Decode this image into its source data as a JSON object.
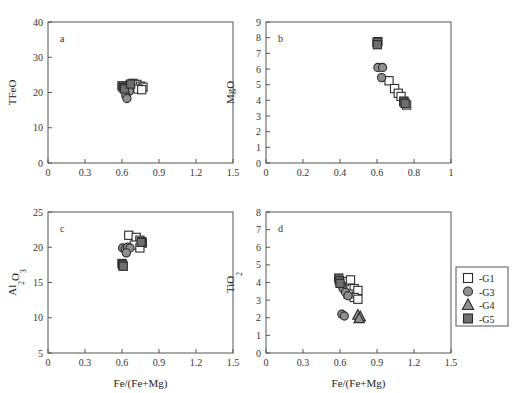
{
  "figure": {
    "width": 517,
    "height": 393,
    "background": "#ffffff"
  },
  "legend": {
    "name": "series-legend",
    "position": "right-of-panel-d",
    "entries": [
      {
        "label": "-G1",
        "marker": "square",
        "fill": "#ffffff",
        "stroke": "#2b2b2b"
      },
      {
        "label": "-G3",
        "marker": "circle",
        "fill": "#8f8f8f",
        "stroke": "#2b2b2b"
      },
      {
        "label": "-G4",
        "marker": "triangle",
        "fill": "#8f8f8f",
        "stroke": "#2b2b2b"
      },
      {
        "label": "-G5",
        "marker": "square",
        "fill": "#6e6e6e",
        "stroke": "#2b2b2b"
      }
    ]
  },
  "chart_data": [
    {
      "id": "panel-a",
      "type": "scatter",
      "panel_letter": "a",
      "title": "",
      "xlabel": "",
      "ylabel": "TFeO",
      "xlim": [
        0,
        1.5
      ],
      "ylim": [
        0,
        40
      ],
      "xticks": [
        0,
        0.3,
        0.6,
        0.9,
        1.2,
        1.5
      ],
      "xticklabels": [
        "0",
        "0.3",
        "0.6",
        "0.9",
        "1.2",
        "1.5"
      ],
      "yticks": [
        0,
        10,
        20,
        30,
        40
      ],
      "yticklabels": [
        "0",
        "10",
        "20",
        "30",
        "40"
      ],
      "grid": false,
      "legend_position": "none",
      "series": [
        {
          "name": "-G1",
          "marker": "square",
          "fill": "#ffffff",
          "stroke": "#2b2b2b",
          "points": [
            [
              0.69,
              22.6
            ],
            [
              0.72,
              22.3
            ],
            [
              0.75,
              21.8
            ],
            [
              0.77,
              21.5
            ],
            [
              0.66,
              22.0
            ],
            [
              0.73,
              21.0
            ],
            [
              0.76,
              20.8
            ]
          ]
        },
        {
          "name": "-G3",
          "marker": "circle",
          "fill": "#8f8f8f",
          "stroke": "#2b2b2b",
          "points": [
            [
              0.62,
              21.3
            ],
            [
              0.64,
              20.6
            ],
            [
              0.66,
              20.4
            ],
            [
              0.63,
              19.2
            ],
            [
              0.64,
              18.3
            ]
          ]
        },
        {
          "name": "-G4",
          "marker": "triangle",
          "fill": "#8f8f8f",
          "stroke": "#2b2b2b",
          "points": []
        },
        {
          "name": "-G5",
          "marker": "square",
          "fill": "#6e6e6e",
          "stroke": "#2b2b2b",
          "points": [
            [
              0.6,
              21.9
            ],
            [
              0.61,
              21.4
            ],
            [
              0.62,
              21.0
            ],
            [
              0.67,
              22.4
            ]
          ]
        }
      ]
    },
    {
      "id": "panel-b",
      "type": "scatter",
      "panel_letter": "b",
      "title": "",
      "xlabel": "",
      "ylabel": "MgO",
      "xlim": [
        0,
        1
      ],
      "ylim": [
        0,
        9
      ],
      "xticks": [
        0,
        0.2,
        0.4,
        0.6,
        0.8,
        1
      ],
      "xticklabels": [
        "0",
        "0.2",
        "0.4",
        "0.6",
        "0.8",
        "1"
      ],
      "yticks": [
        0,
        1,
        2,
        3,
        4,
        5,
        6,
        7,
        8,
        9
      ],
      "yticklabels": [
        "0",
        "1",
        "2",
        "3",
        "4",
        "5",
        "6",
        "7",
        "8",
        "9"
      ],
      "grid": false,
      "legend_position": "none",
      "series": [
        {
          "name": "-G1",
          "marker": "square",
          "fill": "#ffffff",
          "stroke": "#2b2b2b",
          "points": [
            [
              0.665,
              5.25
            ],
            [
              0.695,
              4.75
            ],
            [
              0.715,
              4.45
            ],
            [
              0.73,
              4.25
            ],
            [
              0.745,
              3.95
            ],
            [
              0.76,
              3.7
            ],
            [
              0.605,
              7.75
            ]
          ]
        },
        {
          "name": "-G3",
          "marker": "circle",
          "fill": "#8f8f8f",
          "stroke": "#2b2b2b",
          "points": [
            [
              0.605,
              6.1
            ],
            [
              0.63,
              6.1
            ],
            [
              0.625,
              5.45
            ]
          ]
        },
        {
          "name": "-G4",
          "marker": "triangle",
          "fill": "#8f8f8f",
          "stroke": "#2b2b2b",
          "points": []
        },
        {
          "name": "-G5",
          "marker": "square",
          "fill": "#6e6e6e",
          "stroke": "#2b2b2b",
          "points": [
            [
              0.6,
              7.7
            ],
            [
              0.602,
              7.55
            ],
            [
              0.745,
              3.9
            ],
            [
              0.752,
              3.8
            ]
          ]
        }
      ]
    },
    {
      "id": "panel-c",
      "type": "scatter",
      "panel_letter": "c",
      "title": "",
      "xlabel": "Fe/(Fe+Mg)",
      "ylabel": "Al2O3",
      "xlim": [
        0,
        1.5
      ],
      "ylim": [
        5,
        25
      ],
      "xticks": [
        0,
        0.3,
        0.6,
        0.9,
        1.2,
        1.5
      ],
      "xticklabels": [
        "0",
        "0.3",
        "0.6",
        "0.9",
        "1.2",
        "1.5"
      ],
      "yticks": [
        5,
        10,
        15,
        20,
        25
      ],
      "yticklabels": [
        "5",
        "10",
        "15",
        "20",
        "25"
      ],
      "grid": false,
      "legend_position": "none",
      "series": [
        {
          "name": "-G1",
          "marker": "square",
          "fill": "#ffffff",
          "stroke": "#2b2b2b",
          "points": [
            [
              0.655,
              21.7
            ],
            [
              0.715,
              21.4
            ],
            [
              0.745,
              21.0
            ],
            [
              0.765,
              20.6
            ],
            [
              0.7,
              20.3
            ],
            [
              0.745,
              19.9
            ],
            [
              0.76,
              20.8
            ]
          ]
        },
        {
          "name": "-G3",
          "marker": "circle",
          "fill": "#8f8f8f",
          "stroke": "#2b2b2b",
          "points": [
            [
              0.605,
              19.9
            ],
            [
              0.625,
              19.7
            ],
            [
              0.645,
              20.0
            ],
            [
              0.665,
              19.9
            ],
            [
              0.635,
              19.2
            ]
          ]
        },
        {
          "name": "-G4",
          "marker": "triangle",
          "fill": "#8f8f8f",
          "stroke": "#2b2b2b",
          "points": []
        },
        {
          "name": "-G5",
          "marker": "square",
          "fill": "#6e6e6e",
          "stroke": "#2b2b2b",
          "points": [
            [
              0.6,
              17.7
            ],
            [
              0.605,
              17.5
            ],
            [
              0.61,
              17.3
            ],
            [
              0.755,
              20.7
            ]
          ]
        }
      ]
    },
    {
      "id": "panel-d",
      "type": "scatter",
      "panel_letter": "d",
      "title": "",
      "xlabel": "Fe/(Fe+Mg)",
      "ylabel": "TiO2",
      "xlim": [
        0,
        1.5
      ],
      "ylim": [
        0,
        8
      ],
      "xticks": [
        0,
        0.3,
        0.6,
        0.9,
        1.2,
        1.5
      ],
      "xticklabels": [
        "0",
        "0.3",
        "0.6",
        "0.9",
        "1.2",
        "1.5"
      ],
      "yticks": [
        0,
        1,
        2,
        3,
        4,
        5,
        6,
        7,
        8
      ],
      "yticklabels": [
        "0",
        "1",
        "2",
        "3",
        "4",
        "5",
        "6",
        "7",
        "8"
      ],
      "grid": false,
      "legend_position": "right",
      "series": [
        {
          "name": "-G1",
          "marker": "square",
          "fill": "#ffffff",
          "stroke": "#2b2b2b",
          "points": [
            [
              0.635,
              4.05
            ],
            [
              0.685,
              4.15
            ],
            [
              0.715,
              3.65
            ],
            [
              0.745,
              3.55
            ],
            [
              0.715,
              3.15
            ],
            [
              0.745,
              3.05
            ],
            [
              0.665,
              3.35
            ]
          ]
        },
        {
          "name": "-G3",
          "marker": "circle",
          "fill": "#8f8f8f",
          "stroke": "#2b2b2b",
          "points": [
            [
              0.615,
              3.85
            ],
            [
              0.625,
              3.65
            ],
            [
              0.645,
              3.45
            ],
            [
              0.665,
              3.25
            ],
            [
              0.615,
              2.2
            ],
            [
              0.635,
              2.1
            ]
          ]
        },
        {
          "name": "-G4",
          "marker": "triangle",
          "fill": "#8f8f8f",
          "stroke": "#2b2b2b",
          "points": [
            [
              0.745,
              2.15
            ],
            [
              0.765,
              2.05
            ],
            [
              0.755,
              1.95
            ]
          ]
        },
        {
          "name": "-G5",
          "marker": "square",
          "fill": "#6e6e6e",
          "stroke": "#2b2b2b",
          "points": [
            [
              0.59,
              4.25
            ],
            [
              0.595,
              4.1
            ],
            [
              0.6,
              3.95
            ]
          ]
        }
      ]
    }
  ]
}
